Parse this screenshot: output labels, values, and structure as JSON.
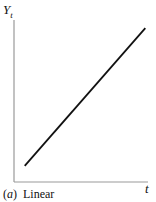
{
  "chart_data": {
    "type": "line",
    "caption_letter": "a",
    "caption_text": "Linear",
    "xlabel": "t",
    "ylabel": "Y",
    "ylabel_sub": "t",
    "grid": false,
    "legend": null,
    "series": [
      {
        "name": "Linear trend",
        "x": [
          0.08,
          0.98
        ],
        "y": [
          0.1,
          0.95
        ]
      }
    ],
    "xlim": [
      0,
      1
    ],
    "ylim": [
      0,
      1
    ],
    "colors": {
      "line": "#111111",
      "axis": "#999999"
    }
  }
}
